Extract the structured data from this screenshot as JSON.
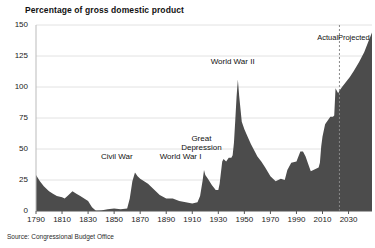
{
  "chart_data": {
    "type": "area",
    "title": "Percentage of gross domestic product",
    "xlabel": "",
    "ylabel": "",
    "xlim": [
      1790,
      2048
    ],
    "ylim": [
      0,
      150
    ],
    "grid": true,
    "legend_position": "none",
    "source": "Source: Congressional Budget Office",
    "series_color": "#4c4c4c",
    "grid_color": "#e2e2e2",
    "divider_year": 2023,
    "divider_style": "dashed",
    "period_labels": [
      {
        "text": "Actual",
        "year": 2014
      },
      {
        "text": "Projected",
        "year": 2034
      }
    ],
    "annotations": [
      {
        "text": "Civil War",
        "year": 1852,
        "value": 40
      },
      {
        "text": "World War I",
        "year": 1901,
        "value": 40
      },
      {
        "text": "Great Depression",
        "year": 1917,
        "value": 55
      },
      {
        "text": "World War II",
        "year": 1941,
        "value": 117
      }
    ],
    "yticks": [
      0,
      25,
      50,
      75,
      100,
      125,
      150
    ],
    "ytick_labels": [
      "0",
      "25",
      "50",
      "75",
      "100",
      "125",
      "150"
    ],
    "xticks": [
      1790,
      1810,
      1830,
      1850,
      1870,
      1890,
      1910,
      1930,
      1950,
      1970,
      1990,
      2010,
      2030
    ],
    "xtick_labels": [
      "1790",
      "1810",
      "1830",
      "1850",
      "1870",
      "1890",
      "1910",
      "1930",
      "1950",
      "1970",
      "1990",
      "2010",
      "2030"
    ],
    "x": [
      1790,
      1793,
      1796,
      1800,
      1803,
      1806,
      1810,
      1812,
      1815,
      1818,
      1821,
      1824,
      1827,
      1830,
      1833,
      1836,
      1840,
      1845,
      1850,
      1855,
      1860,
      1862,
      1864,
      1866,
      1868,
      1870,
      1873,
      1876,
      1880,
      1885,
      1890,
      1895,
      1900,
      1905,
      1910,
      1914,
      1916,
      1918,
      1919,
      1920,
      1922,
      1925,
      1928,
      1930,
      1931,
      1933,
      1934,
      1936,
      1938,
      1940,
      1941,
      1942,
      1943,
      1944,
      1945,
      1946,
      1948,
      1950,
      1952,
      1955,
      1958,
      1960,
      1963,
      1966,
      1970,
      1974,
      1978,
      1981,
      1983,
      1986,
      1990,
      1993,
      1995,
      1997,
      1999,
      2001,
      2003,
      2005,
      2007,
      2008,
      2009,
      2010,
      2012,
      2014,
      2016,
      2018,
      2019,
      2020,
      2021,
      2022,
      2023,
      2025,
      2028,
      2031,
      2034,
      2038,
      2042,
      2045,
      2048
    ],
    "y": [
      29,
      24,
      20,
      16,
      14,
      12,
      11,
      10,
      13,
      16,
      14,
      12,
      10,
      8,
      3,
      0.3,
      0.4,
      1.5,
      2,
      1.5,
      2,
      10,
      24,
      31,
      28,
      26,
      24,
      22,
      18,
      13,
      10,
      10,
      8,
      7,
      6,
      7,
      12,
      25,
      33,
      29,
      26,
      21,
      17,
      17,
      22,
      40,
      42,
      40,
      43,
      43,
      45,
      55,
      73,
      92,
      106,
      93,
      72,
      66,
      61,
      54,
      48,
      44,
      40,
      35,
      28,
      24,
      26,
      25,
      33,
      39,
      40,
      48,
      48,
      44,
      38,
      32,
      33,
      34,
      35,
      39,
      52,
      60,
      70,
      73,
      76,
      76,
      77,
      99,
      97,
      95,
      97,
      100,
      104,
      108,
      113,
      120,
      128,
      136,
      144
    ]
  }
}
